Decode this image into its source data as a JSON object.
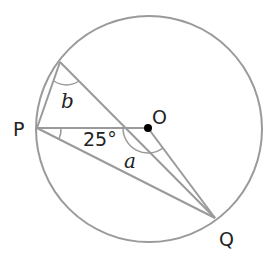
{
  "diagram": {
    "colors": {
      "line": "#9a9a9a",
      "text": "#222222",
      "point": "#000000"
    },
    "circle": {
      "cx": 149,
      "cy": 129,
      "r": 113
    },
    "points": {
      "P": {
        "x": 37,
        "y": 128,
        "label": "P"
      },
      "O": {
        "x": 148,
        "y": 128,
        "label": "O"
      },
      "Q": {
        "x": 215,
        "y": 218,
        "label": "Q"
      },
      "A": {
        "x": 60,
        "y": 62,
        "label": ""
      }
    },
    "angles": {
      "given": {
        "label": "25°",
        "vertex": "P"
      },
      "a": {
        "label": "a",
        "vertex": "O"
      },
      "b": {
        "label": "b",
        "vertex": "A"
      }
    }
  }
}
